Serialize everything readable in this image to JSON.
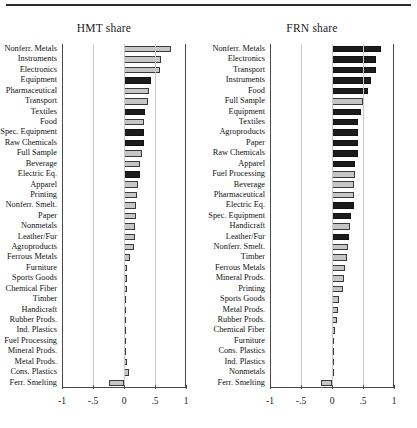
{
  "figure": {
    "panels": [
      {
        "id": "hmt",
        "title": "HMT share",
        "axis": {
          "min": -1,
          "max": 1,
          "ticks": [
            -1,
            -0.5,
            0,
            0.5,
            1
          ],
          "tick_labels": [
            "-1",
            "-.5",
            "0",
            ".5",
            "1"
          ]
        },
        "categories": [
          "Nonferr. Metals",
          "Instruments",
          "Electronics",
          "Equipment",
          "Pharmaceutical",
          "Transport",
          "Textiles",
          "Food",
          "Spec. Equipment",
          "Raw Chemicals",
          "Full Sample",
          "Beverage",
          "Electric Eq.",
          "Apparel",
          "Printing",
          "Nonferr. Smelt.",
          "Paper",
          "Nonmetals",
          "Leather/Fur",
          "Agroproducts",
          "Ferrous Metals",
          "Furniture",
          "Sports Goods",
          "Chemical Fiber",
          "Timber",
          "Handicraft",
          "Rubber Prods.",
          "Ind. Plastics",
          "Fuel Processing",
          "Mineral Prods.",
          "Metal Prods.",
          "Cons. Plastics",
          "Ferr. Smelting"
        ],
        "values": [
          0.765,
          0.6,
          0.575,
          0.44,
          0.405,
          0.385,
          0.345,
          0.325,
          0.325,
          0.325,
          0.295,
          0.255,
          0.25,
          0.22,
          0.21,
          0.2,
          0.195,
          0.185,
          0.175,
          0.155,
          0.09,
          0.055,
          0.05,
          0.045,
          0.04,
          0.03,
          0.025,
          0.02,
          0.02,
          0.035,
          0.05,
          0.075,
          -0.25
        ],
        "shades": [
          "light",
          "light",
          "light",
          "dark",
          "light",
          "light",
          "dark",
          "light",
          "dark",
          "dark",
          "light",
          "light",
          "dark",
          "light",
          "light",
          "light",
          "light",
          "light",
          "light",
          "light",
          "light",
          "light",
          "light",
          "light",
          "light",
          "light",
          "light",
          "light",
          "light",
          "light",
          "light",
          "light",
          "light"
        ]
      },
      {
        "id": "frn",
        "title": "FRN share",
        "axis": {
          "min": -1,
          "max": 1,
          "ticks": [
            -1,
            -0.5,
            0,
            0.5,
            1
          ],
          "tick_labels": [
            "-1",
            "-.5",
            "0",
            ".5",
            "1"
          ]
        },
        "categories": [
          "Nonferr. Metals",
          "Electronics",
          "Transport",
          "Instruments",
          "Food",
          "Full Sample",
          "Equipment",
          "Textiles",
          "Agroproducts",
          "Paper",
          "Raw Chemicals",
          "Apparel",
          "Fuel Processing",
          "Beverage",
          "Pharmaceutical",
          "Electric Eq.",
          "Spec. Equipment",
          "Handicraft",
          "Leather/Fur",
          "Nonferr. Smelt.",
          "Timber",
          "Ferrous Metals",
          "Mineral Prods.",
          "Printing",
          "Sports Goods",
          "Metal Prods.",
          "Rubber Prods.",
          "Chemical Fiber",
          "Furniture",
          "Cons. Plastics",
          "Ind. Plastics",
          "Nonmetals",
          "Ferr. Smelting"
        ],
        "values": [
          0.785,
          0.715,
          0.705,
          0.635,
          0.585,
          0.5,
          0.465,
          0.425,
          0.425,
          0.425,
          0.415,
          0.375,
          0.365,
          0.36,
          0.355,
          0.355,
          0.305,
          0.29,
          0.28,
          0.25,
          0.235,
          0.205,
          0.19,
          0.185,
          0.105,
          0.095,
          0.085,
          0.045,
          0.03,
          0.02,
          0.02,
          0.015,
          -0.18
        ],
        "shades": [
          "dark",
          "dark",
          "dark",
          "dark",
          "dark",
          "light",
          "dark",
          "dark",
          "dark",
          "dark",
          "dark",
          "dark",
          "light",
          "light",
          "light",
          "dark",
          "dark",
          "light",
          "dark",
          "light",
          "light",
          "light",
          "light",
          "light",
          "light",
          "light",
          "light",
          "light",
          "light",
          "light",
          "light",
          "light",
          "light"
        ]
      }
    ]
  },
  "chart_data": {
    "type": "bar",
    "title": "",
    "orientation": "horizontal",
    "grid": true,
    "legend": "none",
    "panels": [
      {
        "title": "HMT share",
        "xlabel": "",
        "ylabel": "",
        "xlim": [
          -1,
          1
        ],
        "xticks": [
          -1,
          -0.5,
          0,
          0.5,
          1
        ],
        "xticklabels": [
          "-1",
          "-.5",
          "0",
          ".5",
          "1"
        ],
        "categories": [
          "Nonferr. Metals",
          "Instruments",
          "Electronics",
          "Equipment",
          "Pharmaceutical",
          "Transport",
          "Textiles",
          "Food",
          "Spec. Equipment",
          "Raw Chemicals",
          "Full Sample",
          "Beverage",
          "Electric Eq.",
          "Apparel",
          "Printing",
          "Nonferr. Smelt.",
          "Paper",
          "Nonmetals",
          "Leather/Fur",
          "Agroproducts",
          "Ferrous Metals",
          "Furniture",
          "Sports Goods",
          "Chemical Fiber",
          "Timber",
          "Handicraft",
          "Rubber Prods.",
          "Ind. Plastics",
          "Fuel Processing",
          "Mineral Prods.",
          "Metal Prods.",
          "Cons. Plastics",
          "Ferr. Smelting"
        ],
        "values": [
          0.765,
          0.6,
          0.575,
          0.44,
          0.405,
          0.385,
          0.345,
          0.325,
          0.325,
          0.325,
          0.295,
          0.255,
          0.25,
          0.22,
          0.21,
          0.2,
          0.195,
          0.185,
          0.175,
          0.155,
          0.09,
          0.055,
          0.05,
          0.045,
          0.04,
          0.03,
          0.025,
          0.02,
          0.02,
          0.035,
          0.05,
          0.075,
          -0.25
        ]
      },
      {
        "title": "FRN share",
        "xlabel": "",
        "ylabel": "",
        "xlim": [
          -1,
          1
        ],
        "xticks": [
          -1,
          -0.5,
          0,
          0.5,
          1
        ],
        "xticklabels": [
          "-1",
          "-.5",
          "0",
          ".5",
          "1"
        ],
        "categories": [
          "Nonferr. Metals",
          "Electronics",
          "Transport",
          "Instruments",
          "Food",
          "Full Sample",
          "Equipment",
          "Textiles",
          "Agroproducts",
          "Paper",
          "Raw Chemicals",
          "Apparel",
          "Fuel Processing",
          "Beverage",
          "Pharmaceutical",
          "Electric Eq.",
          "Spec. Equipment",
          "Handicraft",
          "Leather/Fur",
          "Nonferr. Smelt.",
          "Timber",
          "Ferrous Metals",
          "Mineral Prods.",
          "Printing",
          "Sports Goods",
          "Metal Prods.",
          "Rubber Prods.",
          "Chemical Fiber",
          "Furniture",
          "Cons. Plastics",
          "Ind. Plastics",
          "Nonmetals",
          "Ferr. Smelting"
        ],
        "values": [
          0.785,
          0.715,
          0.705,
          0.635,
          0.585,
          0.5,
          0.465,
          0.425,
          0.425,
          0.425,
          0.415,
          0.375,
          0.365,
          0.36,
          0.355,
          0.355,
          0.305,
          0.29,
          0.28,
          0.25,
          0.235,
          0.205,
          0.19,
          0.185,
          0.105,
          0.095,
          0.085,
          0.045,
          0.03,
          0.02,
          0.02,
          0.015,
          -0.18
        ]
      }
    ],
    "colors": {
      "light_bar": "#c6c6c6",
      "dark_bar": "#1c1c1c",
      "bar_edge": "#3a3a3a",
      "grid": "#c9c9c9",
      "axis": "#4a4a4a"
    }
  }
}
